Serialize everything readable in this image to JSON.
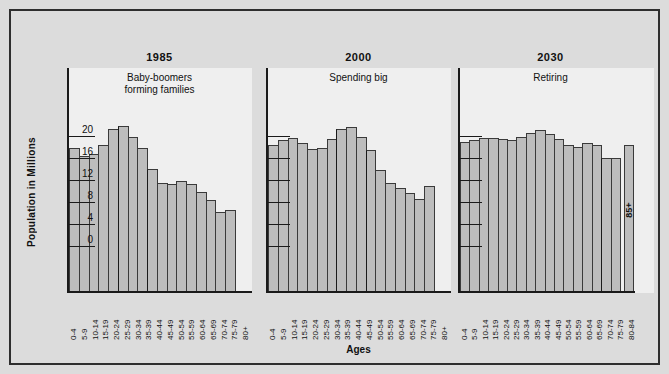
{
  "chart_data": {
    "type": "bar",
    "title": "",
    "xlabel": "Ages",
    "ylabel": "Population in Millions",
    "ylim": [
      -4,
      22
    ],
    "yticks": [
      0,
      4,
      8,
      12,
      16,
      20
    ],
    "ytick_labels": [
      "0",
      "4",
      "8",
      "12",
      "16",
      "20"
    ],
    "grid": false,
    "legend": "none",
    "panels": [
      {
        "title": "1985",
        "annotation": "Baby-boomers\nforming families",
        "annotation_lines": [
          "Baby-boomers",
          "forming families"
        ],
        "categories": [
          "0-4",
          "5-9",
          "10-14",
          "15-19",
          "20-24",
          "25-29",
          "30-34",
          "35-39",
          "40-44",
          "45-49",
          "50-54",
          "55-59",
          "60-64",
          "65-69",
          "70-74",
          "75-79",
          "80+"
        ],
        "values": [
          17.8,
          16.4,
          16.8,
          18.4,
          21.3,
          21.8,
          19.9,
          17.9,
          14.0,
          11.5,
          11.3,
          11.8,
          11.2,
          9.9,
          8.3,
          6.2,
          6.5
        ]
      },
      {
        "title": "2000",
        "annotation": "Spending big",
        "annotation_lines": [
          "Spending big"
        ],
        "categories": [
          "0-4",
          "5-9",
          "10-14",
          "15-19",
          "20-24",
          "25-29",
          "30-34",
          "35-39",
          "40-44",
          "45-49",
          "50-54",
          "55-59",
          "60-64",
          "65-69",
          "70-74",
          "75-79",
          "80+"
        ],
        "values": [
          18.3,
          19.2,
          19.6,
          18.7,
          17.6,
          17.8,
          19.4,
          21.3,
          21.7,
          19.8,
          17.5,
          13.9,
          11.5,
          10.5,
          9.7,
          8.5,
          11.0
        ]
      },
      {
        "title": "2030",
        "annotation": "Retiring",
        "annotation_lines": [
          "Retiring"
        ],
        "categories": [
          "0-4",
          "5-9",
          "10-14",
          "15-19",
          "20-24",
          "25-29",
          "30-34",
          "35-39",
          "40-44",
          "45-49",
          "50-54",
          "55-59",
          "60-64",
          "65-69",
          "70-74",
          "75-79",
          "80-84"
        ],
        "values": [
          18.9,
          19.2,
          19.7,
          19.6,
          19.4,
          19.3,
          19.8,
          20.5,
          21.1,
          20.4,
          19.4,
          18.3,
          18.0,
          18.7,
          18.3,
          16.0,
          16.0
        ],
        "extra_bar": {
          "label": "85+",
          "value": 18.4,
          "detached": true
        }
      }
    ]
  },
  "axis": {
    "y_title": "Population in Millions",
    "x_title": "Ages"
  }
}
